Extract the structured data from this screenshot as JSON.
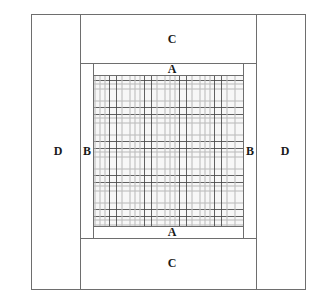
{
  "diagram": {
    "type": "quilt-layout",
    "colors": {
      "border": "#6e6e6e",
      "background": "#ffffff",
      "plaid_dark_line": "#464646",
      "plaid_light_band": "#bebebe",
      "label": "#1a1a1a"
    },
    "regions": {
      "top_c": {
        "label": "C"
      },
      "bottom_c": {
        "label": "C"
      },
      "left_d": {
        "label": "D"
      },
      "right_d": {
        "label": "D"
      },
      "left_b": {
        "label": "B"
      },
      "right_b": {
        "label": "B"
      },
      "top_a": {
        "label": "A"
      },
      "bottom_a": {
        "label": "A"
      },
      "center": {
        "label": "",
        "pattern": "plaid"
      }
    }
  }
}
